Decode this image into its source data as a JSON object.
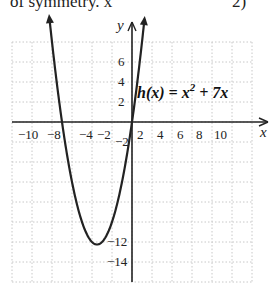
{
  "header": {
    "partial_text_left": "of symmetry. x",
    "partial_text_right": "2)"
  },
  "chart_data": {
    "type": "line",
    "title": "",
    "function_label": "h(x) = x² + 7x",
    "series": [
      {
        "name": "h(x) = x^2 + 7x",
        "x": [
          -8.3,
          -8,
          -7,
          -6,
          -5,
          -4,
          -3.5,
          -3,
          -2,
          -1,
          0,
          1,
          1.2
        ],
        "values": [
          10.9,
          8,
          0,
          -6,
          -10,
          -12,
          -12.25,
          -12,
          -10,
          -6,
          0,
          8,
          9.84
        ]
      }
    ],
    "vertex": [
      -3.5,
      -12.25
    ],
    "x_intercepts": [
      -7,
      0
    ],
    "xlabel": "x",
    "ylabel": "y",
    "xlim": [
      -12,
      12
    ],
    "ylim": [
      -16,
      8
    ],
    "x_tick_labels": [
      "-10",
      "-8",
      "-4",
      "-2",
      "2",
      "4",
      "6",
      "8",
      "10"
    ],
    "y_tick_labels": [
      "6",
      "4",
      "2",
      "-2",
      "-12",
      "-14"
    ],
    "grid": true,
    "grid_step": 2
  }
}
